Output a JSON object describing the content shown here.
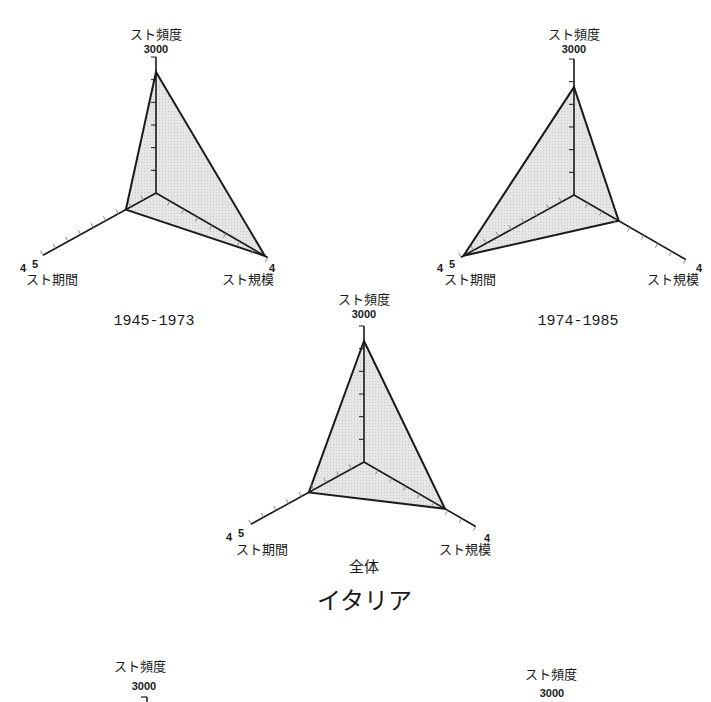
{
  "figure": {
    "country_title": "イタリア",
    "colors": {
      "fill": "#e4e4e4",
      "line": "#1a1a1a",
      "tick": "#888888"
    }
  },
  "axes": {
    "frequency": {
      "label": "スト頻度",
      "max_label": "3000",
      "max": 3000
    },
    "scale": {
      "label": "スト規模",
      "max_label": "4",
      "max": 4
    },
    "duration": {
      "label": "スト期間",
      "max_label": "4.5",
      "max_label_a": "4",
      "max_label_b": "5",
      "max": 4.5
    }
  },
  "panels": [
    {
      "caption": "1945-1973"
    },
    {
      "caption": "1974-1985"
    },
    {
      "caption": "全体"
    },
    {
      "caption": ""
    },
    {
      "caption": ""
    }
  ],
  "chart_data": [
    {
      "type": "radar",
      "title": "1945-1973",
      "axes": [
        "スト頻度",
        "スト規模",
        "スト期間"
      ],
      "axis_max": [
        3000,
        4,
        4.5
      ],
      "values": [
        2670,
        3.9,
        1.2
      ]
    },
    {
      "type": "radar",
      "title": "1974-1985",
      "axes": [
        "スト頻度",
        "スト規模",
        "スト期間"
      ],
      "axis_max": [
        3000,
        4,
        4.5
      ],
      "values": [
        2380,
        1.6,
        4.4
      ]
    },
    {
      "type": "radar",
      "title": "全体",
      "axes": [
        "スト頻度",
        "スト規模",
        "スト期間"
      ],
      "axis_max": [
        3000,
        4,
        4.5
      ],
      "values": [
        2670,
        2.9,
        2.2
      ]
    }
  ]
}
